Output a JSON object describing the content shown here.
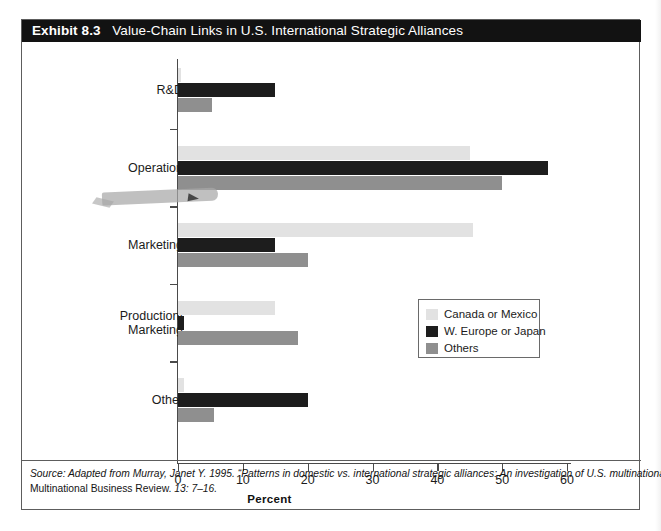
{
  "exhibit": {
    "title_number": "Exhibit 8.3",
    "title_text": "Value-Chain Links in U.S. International Strategic Alliances"
  },
  "legend": {
    "items": [
      {
        "label": "Canada or Mexico",
        "color": "#e2e2e2"
      },
      {
        "label": "W. Europe or Japan",
        "color": "#1d1d1d"
      },
      {
        "label": "Others",
        "color": "#8f8f8f"
      }
    ]
  },
  "axis": {
    "x_title": "Percent",
    "x_ticks": [
      "0",
      "10",
      "20",
      "30",
      "40",
      "50",
      "60"
    ]
  },
  "source": {
    "line1": "Source: Adapted from Murray, Janet Y. 1995. “Patterns in domestic vs. international strategic alliances: An investigation of U.S. multinational firms.”",
    "line2_plain": "Multinational Business Review. ",
    "line2_italic": "13: 7–16."
  },
  "annotation": {
    "highlighted_category": "Operation"
  },
  "chart_data": {
    "type": "bar",
    "orientation": "horizontal",
    "title": "Value-Chain Links in U.S. International Strategic Alliances",
    "xlabel": "Percent",
    "ylabel": "",
    "xlim": [
      0,
      60
    ],
    "xticks": [
      0,
      10,
      20,
      30,
      40,
      50,
      60
    ],
    "grid": false,
    "legend_position": "center-right",
    "categories": [
      "R&D",
      "Operation",
      "Marketing",
      "Production/\nMarketing",
      "Other"
    ],
    "category_labels": [
      "R&D",
      "Operation",
      "Marketing",
      "Production/ Marketing",
      "Other"
    ],
    "series": [
      {
        "name": "Canada or Mexico",
        "color": "#e2e2e2",
        "values": [
          0.4,
          45.0,
          45.5,
          15.0,
          1.0
        ]
      },
      {
        "name": "W. Europe or Japan",
        "color": "#1d1d1d",
        "values": [
          15.0,
          57.0,
          15.0,
          1.0,
          20.0
        ]
      },
      {
        "name": "Others",
        "color": "#8f8f8f",
        "values": [
          5.3,
          50.0,
          20.0,
          18.5,
          5.5
        ]
      }
    ]
  }
}
